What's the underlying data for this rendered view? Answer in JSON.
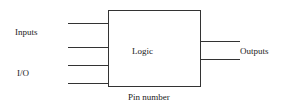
{
  "diagram": {
    "block_label": "Logic",
    "left_labels": {
      "inputs": "Inputs",
      "io": "I/O"
    },
    "right_label": "Outputs",
    "bottom_label": "Pin number",
    "input_line_count": 4,
    "output_line_count": 2,
    "line_color": "#333333"
  }
}
